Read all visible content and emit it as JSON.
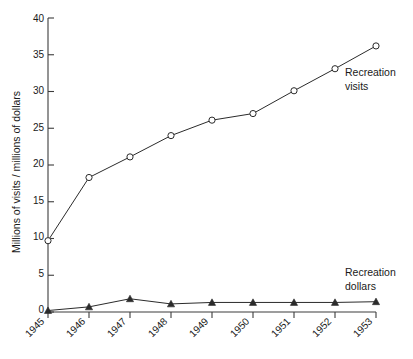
{
  "chart_data": {
    "type": "line",
    "title": "",
    "xlabel": "",
    "ylabel": "Millions of visits / millions of dollars",
    "categories": [
      "1945",
      "1946",
      "1947",
      "1948",
      "1949",
      "1950",
      "1951",
      "1952",
      "1953"
    ],
    "x": [
      1945,
      1946,
      1947,
      1948,
      1949,
      1950,
      1951,
      1952,
      1953
    ],
    "xlim": [
      1945,
      1953
    ],
    "ylim": [
      0,
      40
    ],
    "yticks": [
      0,
      5,
      10,
      15,
      20,
      25,
      30,
      35,
      40
    ],
    "ytick_labels": [
      "0",
      "5",
      "10",
      "15",
      "20",
      "25",
      "30",
      "35",
      "40"
    ],
    "grid": false,
    "legend_position": "inline-right-of-line-end",
    "series": [
      {
        "name": "Recreation visits",
        "marker": "open-circle",
        "color": "#2b2b2b",
        "label_lines": [
          "Recreation",
          "visits"
        ],
        "values": [
          9.7,
          18.3,
          21.1,
          24.0,
          26.1,
          27.0,
          30.1,
          33.1,
          36.2
        ]
      },
      {
        "name": "Recreation dollars",
        "marker": "filled-triangle",
        "color": "#2b2b2b",
        "label_lines": [
          "Recreation",
          "dollars"
        ],
        "values": [
          0.2,
          0.7,
          1.8,
          1.1,
          1.3,
          1.3,
          1.3,
          1.3,
          1.4
        ]
      }
    ]
  },
  "axes": {
    "y_title": "Millions of visits / millions of dollars"
  },
  "annotations": {
    "visits_label_line1": "Recreation",
    "visits_label_line2": "visits",
    "dollars_label_line1": "Recreation",
    "dollars_label_line2": "dollars"
  },
  "colors": {
    "line": "#2b2b2b",
    "axis": "#3c3c3c",
    "background": "#ffffff",
    "text": "#1a1a1a"
  }
}
